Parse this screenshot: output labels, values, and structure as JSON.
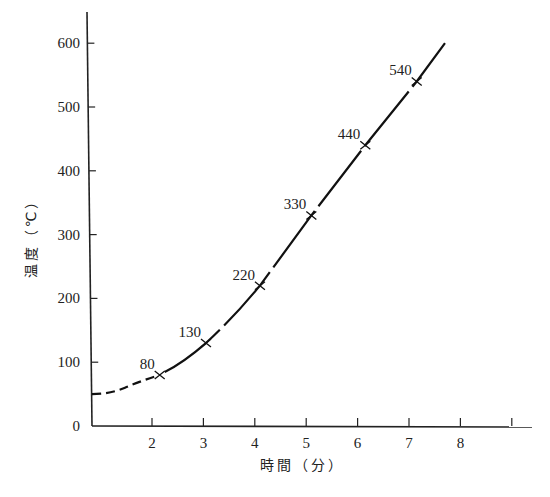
{
  "chart_data": {
    "type": "line",
    "title": "",
    "xlabel": "時間（分）",
    "ylabel": "温度（℃）",
    "xlim": [
      0.8,
      9.4
    ],
    "ylim": [
      0,
      620
    ],
    "x_ticks": [
      2,
      3,
      4,
      5,
      6,
      7,
      8,
      9
    ],
    "x_tick_labels": [
      "2",
      "3",
      "4",
      "5",
      "6",
      "7",
      "8",
      ""
    ],
    "y_ticks": [
      0,
      100,
      200,
      300,
      400,
      500,
      600
    ],
    "y_tick_labels": [
      "0",
      "100",
      "200",
      "300",
      "400",
      "500",
      "600"
    ],
    "grid": false,
    "legend": null,
    "series": [
      {
        "name": "measured",
        "style": "solid with x markers",
        "points": [
          {
            "x": 2.15,
            "y": 80,
            "label": "80"
          },
          {
            "x": 3.05,
            "y": 130,
            "label": "130"
          },
          {
            "x": 4.1,
            "y": 220,
            "label": "220"
          },
          {
            "x": 5.1,
            "y": 330,
            "label": "330"
          },
          {
            "x": 6.15,
            "y": 440,
            "label": "440"
          },
          {
            "x": 7.15,
            "y": 540,
            "label": "540"
          }
        ],
        "curve_end": {
          "x": 7.7,
          "y": 600
        }
      },
      {
        "name": "extrapolated",
        "style": "dashed",
        "points": [
          {
            "x": 0.8,
            "y": 50
          },
          {
            "x": 1.5,
            "y": 62
          },
          {
            "x": 2.15,
            "y": 80
          }
        ]
      }
    ]
  },
  "axes": {
    "x_title": "時間（分）",
    "y_title": "温度（℃）"
  }
}
